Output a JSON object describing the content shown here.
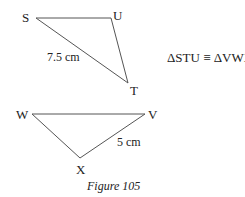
{
  "triangle_stu": {
    "vertices": {
      "S": "S",
      "U": "U",
      "T": "T"
    },
    "side_label": "7.5 cm"
  },
  "triangle_vwx": {
    "vertices": {
      "W": "W",
      "V": "V",
      "X": "X"
    },
    "side_label": "5 cm"
  },
  "congruence_statement": "ΔSTU ≡ ΔVWX",
  "caption": "Figure 105",
  "colors": {
    "line": "#555555",
    "text": "#222222"
  }
}
